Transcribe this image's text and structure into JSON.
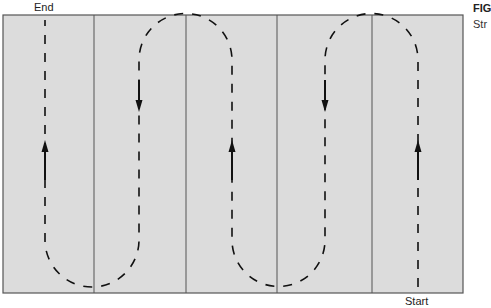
{
  "labels": {
    "end": "End",
    "start": "Start",
    "figure": "FIG",
    "caption_fragment": "Str"
  },
  "diagram": {
    "type": "serpentine-path",
    "strips": 5,
    "colors": {
      "field": "#dcdcdc",
      "border": "#555555",
      "path": "#111111"
    },
    "passes": [
      {
        "x": 45,
        "direction": "up"
      },
      {
        "x": 139,
        "direction": "down"
      },
      {
        "x": 232,
        "direction": "up"
      },
      {
        "x": 325,
        "direction": "down"
      },
      {
        "x": 418,
        "direction": "up"
      }
    ]
  }
}
